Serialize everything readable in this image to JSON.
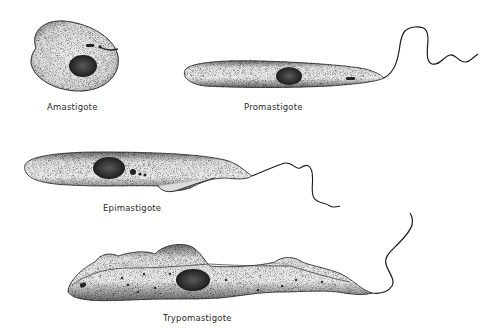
{
  "diagram": {
    "type": "scientific-illustration",
    "colors": {
      "background": "#ffffff",
      "ink": "#1a1a1a",
      "cell_fill": "#ededed",
      "nucleus": "#2b2b2b"
    },
    "forms": [
      {
        "id": "amastigote",
        "label": "Amastigote",
        "has_flagellum": false,
        "shape": "oval"
      },
      {
        "id": "promastigote",
        "label": "Promastigote",
        "has_flagellum": true,
        "flagellum_origin": "anterior",
        "shape": "elongated"
      },
      {
        "id": "epimastigote",
        "label": "Epimastigote",
        "has_flagellum": true,
        "flagellum_origin": "juxtanuclear",
        "undulating_membrane": "short",
        "shape": "elongated"
      },
      {
        "id": "trypomastigote",
        "label": "Trypomastigote",
        "has_flagellum": true,
        "flagellum_origin": "posterior",
        "undulating_membrane": "long",
        "shape": "wavy elongated"
      }
    ]
  }
}
